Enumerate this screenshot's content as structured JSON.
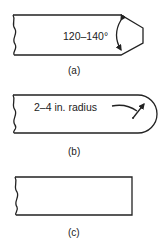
{
  "figures": [
    {
      "id": "a",
      "caption": "(a)",
      "annotation": "120–140°",
      "shape": "chamfered-end"
    },
    {
      "id": "b",
      "caption": "(b)",
      "annotation": "2–4 in. radius",
      "shape": "rounded-end"
    },
    {
      "id": "c",
      "caption": "(c)",
      "annotation": "",
      "shape": "square-end"
    }
  ]
}
